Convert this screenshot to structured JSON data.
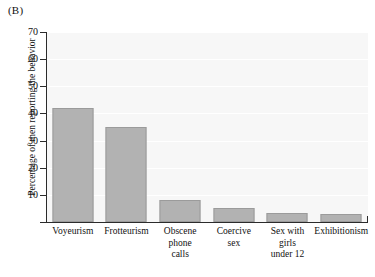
{
  "figure": {
    "panel_label": "(B)"
  },
  "chart_data": {
    "type": "bar",
    "title": "",
    "xlabel": "",
    "ylabel": "Percentage of men reporting the behavior",
    "ylim": [
      0,
      70
    ],
    "yticks": [
      0,
      10,
      20,
      30,
      40,
      50,
      60,
      70
    ],
    "ytick_labels": [
      "",
      "10",
      "20",
      "30",
      "40",
      "50",
      "60",
      "70"
    ],
    "grid": true,
    "legend": "none",
    "bar_color": "#b2b2b2",
    "plot_background": "#f7f7f7",
    "categories": [
      "Voyeurism",
      "Frotteurism",
      "Obscene phone calls",
      "Coercive sex",
      "Sex with girls under 12",
      "Exhibitionism"
    ],
    "category_lines": [
      [
        "Voyeurism"
      ],
      [
        "Frotteurism"
      ],
      [
        "Obscene",
        "phone",
        "calls"
      ],
      [
        "Coercive",
        "sex"
      ],
      [
        "Sex with",
        "girls",
        "under 12"
      ],
      [
        "Exhibitionism"
      ]
    ],
    "values": [
      42,
      35,
      8,
      5,
      3.5,
      3
    ]
  }
}
